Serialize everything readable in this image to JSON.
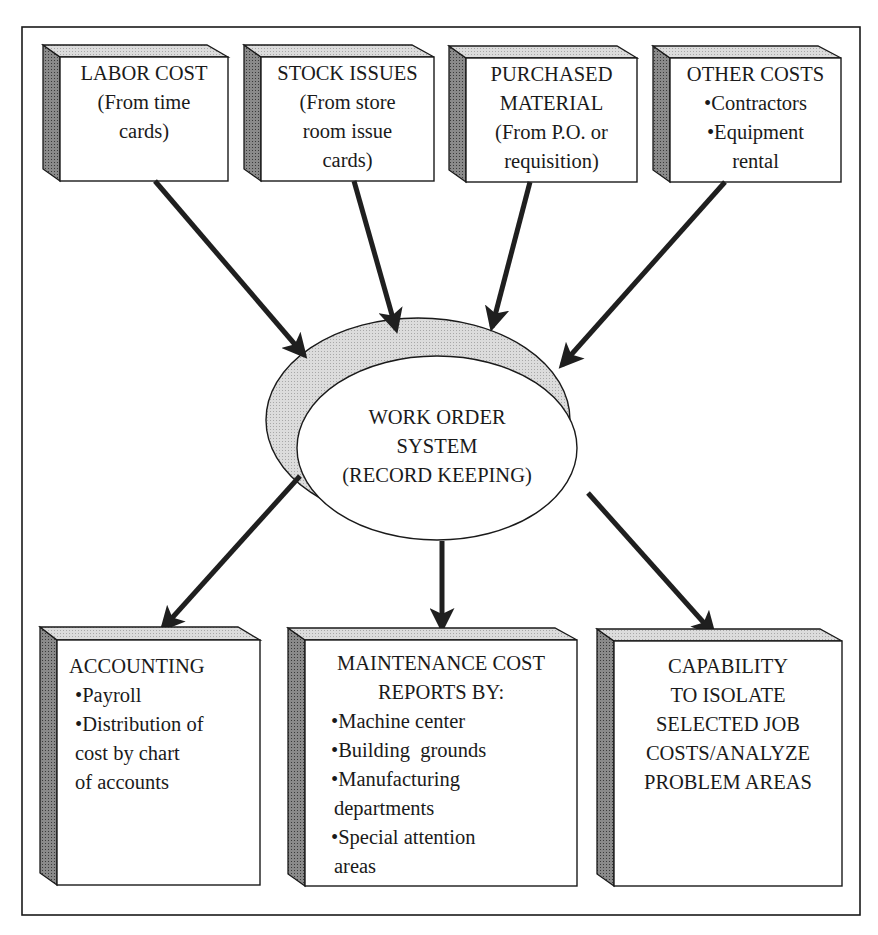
{
  "diagram": {
    "colors": {
      "frame": "#1a1a1a",
      "box_face": "#ffffff",
      "box_side": "#6e6e6e",
      "box_top": "#cfcfcf",
      "ellipse_shadow": "#d9d9d9",
      "arrow": "#1f1f1f"
    },
    "inputs": [
      {
        "id": "labor-cost",
        "title": "LABOR COST",
        "lines": [
          "(From time",
          "cards)"
        ]
      },
      {
        "id": "stock-issues",
        "title": "STOCK ISSUES",
        "lines": [
          "(From store",
          "room issue",
          "cards)"
        ]
      },
      {
        "id": "purchased-material",
        "title": "PURCHASED",
        "lines": [
          "MATERIAL",
          "(From P.O. or",
          "requisition)"
        ]
      },
      {
        "id": "other-costs",
        "title": "OTHER COSTS",
        "lines": [
          "Contractors",
          "Equipment",
          "rental"
        ],
        "bulleted": [
          true,
          true,
          false
        ]
      }
    ],
    "center": {
      "lines": [
        "WORK ORDER",
        "SYSTEM",
        "(RECORD KEEPING)"
      ]
    },
    "outputs": [
      {
        "id": "accounting",
        "title": "ACCOUNTING",
        "lines": [
          "Payroll",
          "Distribution of",
          "cost by chart",
          "of accounts"
        ],
        "bulleted": [
          true,
          true,
          false,
          false
        ]
      },
      {
        "id": "maintenance-cost-reports",
        "title": "MAINTENANCE COST",
        "lines": [
          "REPORTS BY:",
          "Machine center",
          "Building  grounds",
          "Manufacturing",
          "departments",
          "Special attention",
          "areas"
        ],
        "bulleted": [
          false,
          true,
          true,
          true,
          false,
          true,
          false
        ]
      },
      {
        "id": "capability",
        "title": "CAPABILITY",
        "lines": [
          "TO ISOLATE",
          "SELECTED JOB",
          "COSTS/ANALYZE",
          "PROBLEM AREAS"
        ]
      }
    ],
    "edges": [
      {
        "from": "labor-cost",
        "to": "work-order-system"
      },
      {
        "from": "stock-issues",
        "to": "work-order-system"
      },
      {
        "from": "purchased-material",
        "to": "work-order-system"
      },
      {
        "from": "other-costs",
        "to": "work-order-system"
      },
      {
        "from": "work-order-system",
        "to": "accounting"
      },
      {
        "from": "work-order-system",
        "to": "maintenance-cost-reports"
      },
      {
        "from": "work-order-system",
        "to": "capability"
      }
    ]
  }
}
